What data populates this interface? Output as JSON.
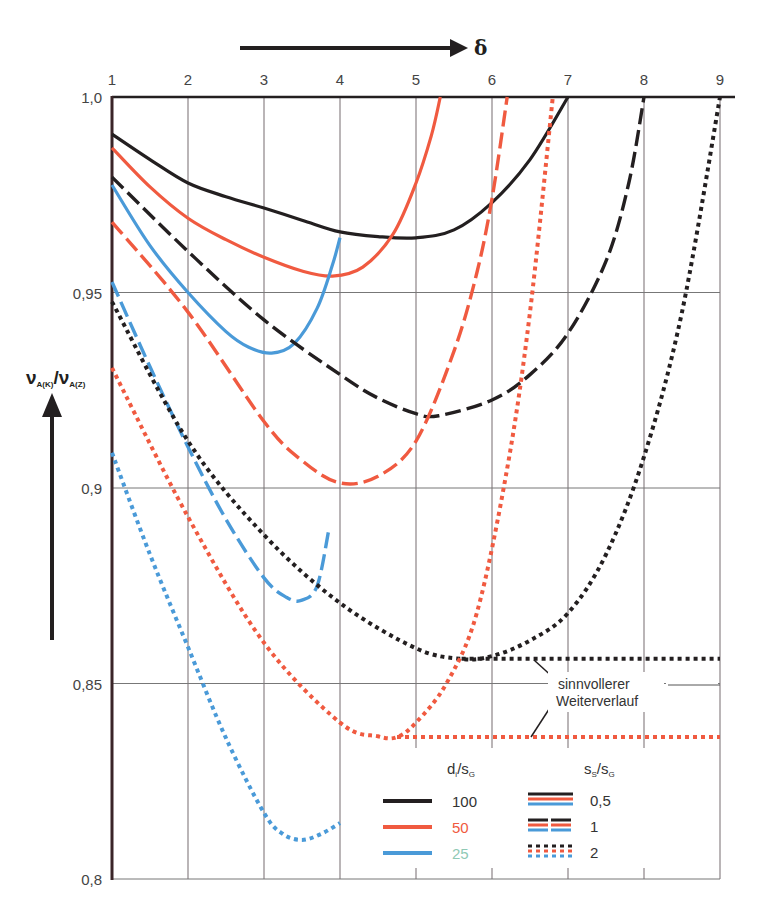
{
  "chart_data": {
    "type": "line",
    "title": "",
    "xlabel": "δ",
    "ylabel": "ν_A(K)/ν_A(Z)",
    "ylabel_parts": {
      "main1": "ν",
      "sub1": "A(K)",
      "slash": "/",
      "main2": "ν",
      "sub2": "A(Z)"
    },
    "xlim": [
      1,
      9
    ],
    "ylim": [
      0.8,
      1.0
    ],
    "x_ticks": [
      "1",
      "2",
      "3",
      "4",
      "5",
      "6",
      "7",
      "8",
      "9"
    ],
    "y_ticks": [
      {
        "value": 1.0,
        "label": "1,0"
      },
      {
        "value": 0.95,
        "label": "0,95"
      },
      {
        "value": 0.9,
        "label": "0,9"
      },
      {
        "value": 0.85,
        "label": "0,85"
      },
      {
        "value": 0.8,
        "label": "0,8"
      }
    ],
    "grid": true,
    "x_axis_position": "top",
    "legend_position": "bottom-right inside",
    "legend": {
      "color_title": "d_i/s_G",
      "color_title_parts": {
        "d": "d",
        "i": "i",
        "slash": "/s",
        "g": "G"
      },
      "color_entries": [
        {
          "label": "100",
          "color": "#231f20",
          "text_color": "#333333"
        },
        {
          "label": "50",
          "color": "#f05a40",
          "text_color": "#f05a40"
        },
        {
          "label": "25",
          "color": "#4a9ad8",
          "text_color": "#8fc9b5"
        }
      ],
      "style_title": "s_S/s_G",
      "style_title_parts": {
        "s1": "s",
        "S": "S",
        "slash": "/s",
        "G": "G"
      },
      "style_entries": [
        {
          "label": "0,5",
          "style": "solid"
        },
        {
          "label": "1",
          "style": "dashed"
        },
        {
          "label": "2",
          "style": "dotted"
        }
      ]
    },
    "annotation": {
      "line1": "sinnvollerer",
      "line2": "Weiterverlauf"
    },
    "colors": {
      "black": "#231f20",
      "red": "#f05a40",
      "blue": "#4a9ad8",
      "grid": "#a9a3a5",
      "axis": "#231f20"
    },
    "series": [
      {
        "name": "d_i/s_G=100, s_S/s_G=0,5",
        "color": "black",
        "style": "solid",
        "x": [
          1.0,
          1.5,
          2.0,
          2.5,
          3.0,
          3.5,
          4.0,
          4.5,
          5.0,
          5.5,
          6.0,
          6.5,
          7.0
        ],
        "y": [
          0.9905,
          0.984,
          0.978,
          0.9745,
          0.9716,
          0.9685,
          0.9655,
          0.9643,
          0.964,
          0.966,
          0.973,
          0.984,
          1.0
        ]
      },
      {
        "name": "d_i/s_G=50, s_S/s_G=0,5",
        "color": "red",
        "style": "solid",
        "x": [
          1.0,
          1.5,
          2.0,
          2.5,
          3.0,
          3.5,
          3.9,
          4.3,
          4.7,
          5.0,
          5.2,
          5.32
        ],
        "y": [
          0.987,
          0.977,
          0.969,
          0.9635,
          0.959,
          0.9555,
          0.9542,
          0.9565,
          0.965,
          0.978,
          0.99,
          1.0
        ]
      },
      {
        "name": "d_i/s_G=25, s_S/s_G=0,5",
        "color": "blue",
        "style": "solid",
        "x": [
          1.0,
          1.5,
          2.0,
          2.5,
          2.8,
          3.1,
          3.4,
          3.7,
          3.9,
          4.0
        ],
        "y": [
          0.9775,
          0.962,
          0.95,
          0.94,
          0.936,
          0.9345,
          0.937,
          0.946,
          0.957,
          0.964
        ]
      },
      {
        "name": "d_i/s_G=100, s_S/s_G=1",
        "color": "black",
        "style": "dashed",
        "x": [
          1.0,
          2.0,
          3.0,
          4.0,
          4.5,
          5.0,
          5.3,
          6.0,
          6.5,
          7.0,
          7.5,
          7.8,
          8.0
        ],
        "y": [
          0.9795,
          0.9605,
          0.943,
          0.929,
          0.923,
          0.919,
          0.9185,
          0.9225,
          0.929,
          0.9396,
          0.958,
          0.978,
          1.0
        ]
      },
      {
        "name": "d_i/s_G=50, s_S/s_G=1",
        "color": "red",
        "style": "dashed",
        "x": [
          1.0,
          2.0,
          3.0,
          3.5,
          4.0,
          4.5,
          5.0,
          5.5,
          5.8,
          6.0,
          6.2
        ],
        "y": [
          0.968,
          0.945,
          0.917,
          0.907,
          0.9013,
          0.903,
          0.912,
          0.935,
          0.955,
          0.974,
          1.0
        ]
      },
      {
        "name": "d_i/s_G=25, s_S/s_G=1",
        "color": "blue",
        "style": "dashed",
        "x": [
          1.0,
          1.5,
          2.0,
          2.5,
          3.0,
          3.3,
          3.5,
          3.7,
          3.85
        ],
        "y": [
          0.9527,
          0.931,
          0.9105,
          0.892,
          0.877,
          0.872,
          0.8713,
          0.875,
          0.889
        ]
      },
      {
        "name": "d_i/s_G=100, s_S/s_G=2",
        "color": "black",
        "style": "dotted",
        "x": [
          1.0,
          2.0,
          3.0,
          4.0,
          5.0,
          5.6,
          6.0,
          6.5,
          7.0,
          7.5,
          8.0,
          8.5,
          9.0
        ],
        "y": [
          0.9476,
          0.912,
          0.888,
          0.8706,
          0.859,
          0.8563,
          0.857,
          0.861,
          0.868,
          0.883,
          0.908,
          0.945,
          1.0
        ]
      },
      {
        "name": "d_i/s_G=50, s_S/s_G=2",
        "color": "red",
        "style": "dotted",
        "x": [
          1.0,
          2.0,
          3.0,
          4.0,
          4.5,
          4.75,
          5.0,
          5.4,
          5.8,
          6.2,
          6.5,
          6.8
        ],
        "y": [
          0.9307,
          0.8926,
          0.8604,
          0.84,
          0.8365,
          0.8363,
          0.84,
          0.85,
          0.868,
          0.905,
          0.945,
          1.0
        ]
      },
      {
        "name": "d_i/s_G=25, s_S/s_G=2",
        "color": "blue",
        "style": "dotted",
        "x": [
          1.0,
          1.5,
          2.0,
          2.5,
          3.0,
          3.25,
          3.5,
          3.75,
          4.0
        ],
        "y": [
          0.909,
          0.883,
          0.8593,
          0.836,
          0.8169,
          0.8115,
          0.81,
          0.8115,
          0.8143
        ]
      },
      {
        "name": "sinnvollerer Weiterverlauf (d_i/s_G=100, s_S/s_G=2)",
        "color": "black",
        "style": "dotted",
        "x": [
          5.6,
          9.0
        ],
        "y": [
          0.8563,
          0.8563
        ]
      },
      {
        "name": "sinnvollerer Weiterverlauf (d_i/s_G=50, s_S/s_G=2)",
        "color": "red",
        "style": "dotted",
        "x": [
          4.75,
          9.0
        ],
        "y": [
          0.8363,
          0.8363
        ]
      }
    ]
  }
}
